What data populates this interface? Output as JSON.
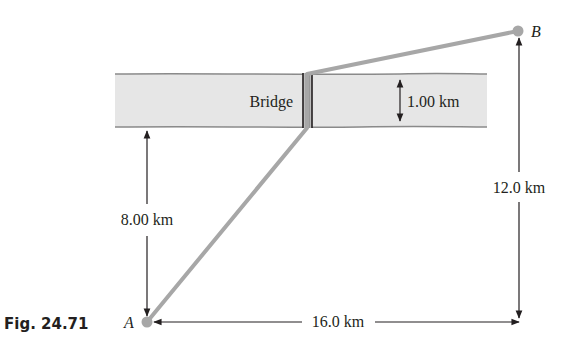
{
  "figure": {
    "caption": "Fig. 24.71",
    "river_label": "Bridge",
    "colors": {
      "river_fill": "#e6e6e6",
      "river_edge": "#8a8a8a",
      "path": "#a7a7a7",
      "dimension": "#231f20",
      "bridge": "#555555"
    },
    "points": {
      "A": {
        "label": "A"
      },
      "B": {
        "label": "B"
      }
    },
    "dimensions": {
      "river_width": "1.00 km",
      "A_to_river": "8.00 km",
      "vertical_total": "12.0 km",
      "horizontal_total": "16.0 km"
    }
  }
}
